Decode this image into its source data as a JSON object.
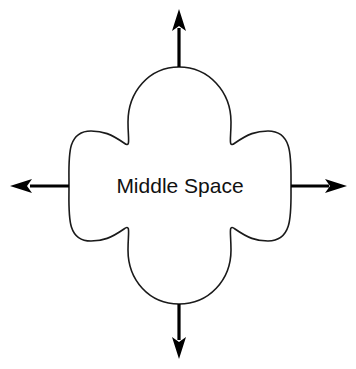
{
  "figure": {
    "name": "middle-space-diagram",
    "background_color": "#ffffff",
    "stroke_color": "#1a1a1a",
    "arrow_color": "#000000",
    "text_color": "#111111",
    "center_label": "Middle Space"
  },
  "shape": {
    "name": "quatrefoil-four-lobed-outline",
    "type": "four-lobed cross / quatrefoil",
    "center": {
      "x": 179,
      "y": 186
    },
    "extents": {
      "left": 69,
      "right": 291,
      "top": 67,
      "bottom": 304
    },
    "lobe_count": 4
  },
  "arrows": [
    {
      "name": "arrow-up",
      "direction": "up",
      "label": "",
      "from": {
        "x": 179,
        "y": 67
      },
      "to": {
        "x": 179,
        "y": 10
      }
    },
    {
      "name": "arrow-right",
      "direction": "right",
      "label": "",
      "from": {
        "x": 291,
        "y": 186
      },
      "to": {
        "x": 346,
        "y": 186
      }
    },
    {
      "name": "arrow-down",
      "direction": "down",
      "label": "",
      "from": {
        "x": 179,
        "y": 304
      },
      "to": {
        "x": 179,
        "y": 358
      }
    },
    {
      "name": "arrow-left",
      "direction": "left",
      "label": "",
      "from": {
        "x": 69,
        "y": 186
      },
      "to": {
        "x": 11,
        "y": 186
      }
    }
  ]
}
